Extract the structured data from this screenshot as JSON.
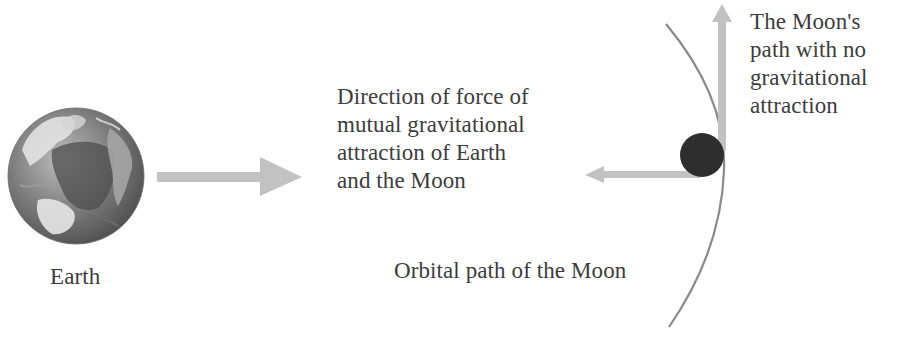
{
  "diagram": {
    "labels": {
      "earth": "Earth",
      "force_direction": "Direction of force of\nmutual gravitational\nattraction of Earth\nand the Moon",
      "moon_path_no_gravity": "The Moon's\npath with no\ngravitational\nattraction",
      "orbital_path": "Orbital path of the Moon"
    },
    "elements": {
      "earth": {
        "shape": "circle",
        "cx": 76,
        "cy": 176,
        "r": 68,
        "style": "grayscale-globe"
      },
      "moon": {
        "shape": "circle",
        "cx": 702,
        "cy": 155,
        "r": 22,
        "color": "#2e2e2e"
      },
      "earth_arrow": {
        "direction": "right",
        "from": [
          157,
          177
        ],
        "to": [
          302,
          177
        ],
        "color": "#c2c2c2"
      },
      "gravity_arrow": {
        "direction": "left",
        "from": [
          700,
          174
        ],
        "to": [
          585,
          174
        ],
        "color": "#c2c2c2"
      },
      "inertia_arrow": {
        "direction": "up",
        "from": [
          722,
          150
        ],
        "to": [
          722,
          5
        ],
        "color": "#c2c2c2"
      },
      "orbit_arc": {
        "color": "#8a8a8a",
        "start": [
          666,
          24
        ],
        "end": [
          669,
          327
        ]
      }
    },
    "colors": {
      "arrow": "#c2c2c2",
      "orbit": "#8a8a8a",
      "moon": "#2e2e2e",
      "text": "#3c3c3c"
    }
  }
}
